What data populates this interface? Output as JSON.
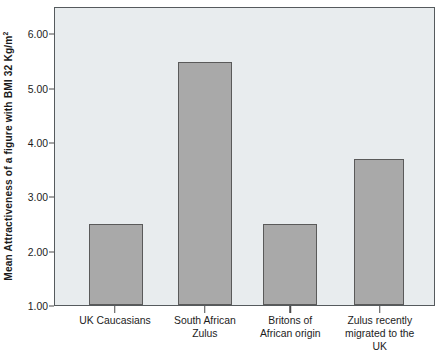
{
  "chart_data": {
    "type": "bar",
    "title": "",
    "subtitle": "",
    "xlabel": "",
    "ylabel": "Mean Attractiveness of a figure with BMI 32 Kg/m",
    "ylabel_superscript": "2",
    "categories": [
      "UK Caucasians",
      "South African Zulus",
      "Britons of African origin",
      "Zulus recently migrated to the UK"
    ],
    "category_lines": [
      [
        "UK Caucasians"
      ],
      [
        "South African",
        "Zulus"
      ],
      [
        "Britons of",
        "African origin"
      ],
      [
        "Zulus recently",
        "migrated to the",
        "UK"
      ]
    ],
    "values": [
      2.5,
      5.5,
      2.5,
      3.7
    ],
    "ylim": [
      1.0,
      6.5
    ],
    "ytick_values": [
      1.0,
      2.0,
      3.0,
      4.0,
      5.0,
      6.0
    ],
    "ytick_labels": [
      "1.00",
      "2.00",
      "3.00",
      "4.00",
      "5.00",
      "6.00"
    ],
    "grid": false,
    "legend": null,
    "legend_position": "none",
    "colors": {
      "bar_fill": "#a9a9a9",
      "bar_edge": "#5a5a5a",
      "plot_background": "#e8ecee",
      "plot_border": "#555a5d",
      "text": "#1c1c1c",
      "page_background": "#ffffff"
    },
    "bar_geometry": [
      {
        "center_pct": 16.0,
        "width_pct": 14.2
      },
      {
        "center_pct": 39.6,
        "width_pct": 14.4
      },
      {
        "center_pct": 62.0,
        "width_pct": 14.4
      },
      {
        "center_pct": 85.5,
        "width_pct": 13.4
      }
    ]
  }
}
